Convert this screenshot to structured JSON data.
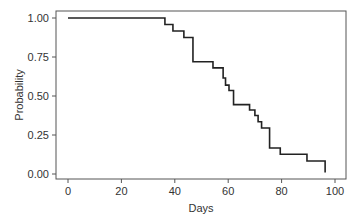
{
  "chart_data": {
    "type": "line",
    "subtype": "step (Kaplan-Meier survival curve)",
    "title": "",
    "xlabel": "Days",
    "ylabel": "Probability",
    "xlim": [
      0,
      100
    ],
    "ylim": [
      0,
      1
    ],
    "x_ticks": [
      0,
      20,
      40,
      60,
      80,
      100
    ],
    "x_tick_labels": [
      "0",
      "20",
      "40",
      "60",
      "80",
      "100"
    ],
    "y_ticks": [
      0,
      0.25,
      0.5,
      0.75,
      1.0
    ],
    "y_tick_labels": [
      "0.00",
      "0.25",
      "0.50",
      "0.75",
      "1.00"
    ],
    "grid": false,
    "legend": null,
    "series": [
      {
        "name": "Survival",
        "color": "#222222",
        "steps": [
          {
            "x": 0,
            "y": 1.0
          },
          {
            "x": 36.3,
            "y": 0.958
          },
          {
            "x": 39.3,
            "y": 0.917
          },
          {
            "x": 43.4,
            "y": 0.875
          },
          {
            "x": 46.8,
            "y": 0.72
          },
          {
            "x": 54.3,
            "y": 0.68
          },
          {
            "x": 58.1,
            "y": 0.615
          },
          {
            "x": 59.0,
            "y": 0.57
          },
          {
            "x": 60.3,
            "y": 0.535
          },
          {
            "x": 62.0,
            "y": 0.445
          },
          {
            "x": 68.0,
            "y": 0.41
          },
          {
            "x": 70.0,
            "y": 0.375
          },
          {
            "x": 71.2,
            "y": 0.335
          },
          {
            "x": 72.5,
            "y": 0.295
          },
          {
            "x": 75.5,
            "y": 0.167
          },
          {
            "x": 79.5,
            "y": 0.127
          },
          {
            "x": 89.5,
            "y": 0.083
          },
          {
            "x": 96.3,
            "y": 0.01
          }
        ]
      }
    ]
  }
}
